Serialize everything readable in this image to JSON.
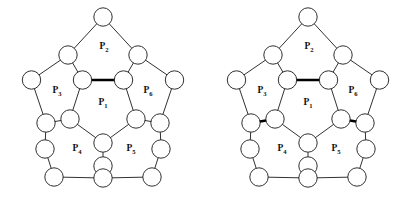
{
  "figure": {
    "title": "",
    "background_color": "#ffffff",
    "stroke_color": "#1a1a1a",
    "bold_stroke_color": "#000000",
    "node_fill": "#ffffff",
    "width": 410,
    "height": 197,
    "panel_count": 2
  },
  "face_labels": {
    "p1": "P",
    "p1_sub": "1",
    "p2": "P",
    "p2_sub": "2",
    "p3": "P",
    "p3_sub": "3",
    "p4": "P",
    "p4_sub": "4",
    "p5": "P",
    "p5_sub": "5",
    "p6": "P",
    "p6_sub": "6"
  },
  "graph": {
    "type": "dodecahedral-schlegel-diagram",
    "node_radius": 9.2,
    "node_count": 20,
    "edge_count": 30,
    "nodes": [
      {
        "id": "i1",
        "x": 82.5,
        "y": 80.0
      },
      {
        "id": "i2",
        "x": 123.5,
        "y": 80.0
      },
      {
        "id": "i3",
        "x": 136.0,
        "y": 119.0
      },
      {
        "id": "i4",
        "x": 103.0,
        "y": 143.0
      },
      {
        "id": "i5",
        "x": 70.0,
        "y": 119.0
      },
      {
        "id": "m1",
        "x": 68.0,
        "y": 55.0
      },
      {
        "id": "m2",
        "x": 138.0,
        "y": 55.0
      },
      {
        "id": "m3",
        "x": 160.0,
        "y": 123.0
      },
      {
        "id": "m4",
        "x": 103.0,
        "y": 166.0
      },
      {
        "id": "m5",
        "x": 46.0,
        "y": 123.0
      },
      {
        "id": "n1",
        "x": 103.0,
        "y": 17.0
      },
      {
        "id": "n2",
        "x": 174.5,
        "y": 80.0
      },
      {
        "id": "n3",
        "x": 159.0,
        "y": 150.0
      },
      {
        "id": "n4",
        "x": 47.0,
        "y": 150.0
      },
      {
        "id": "n5",
        "x": 31.5,
        "y": 80.0
      },
      {
        "id": "o1",
        "x": 161.0,
        "y": 149.0
      },
      {
        "id": "o2",
        "x": 152.0,
        "y": 177.0
      },
      {
        "id": "o3",
        "x": 103.0,
        "y": 178.0
      },
      {
        "id": "o4",
        "x": 54.0,
        "y": 177.0
      },
      {
        "id": "o5",
        "x": 45.0,
        "y": 149.0
      }
    ],
    "inner_pentagon": [
      "i1",
      "i2",
      "i3",
      "i4",
      "i5"
    ],
    "spokes": [
      [
        "i1",
        "m1"
      ],
      [
        "i2",
        "m2"
      ],
      [
        "i3",
        "m3"
      ],
      [
        "i4",
        "m4"
      ],
      [
        "i5",
        "m5"
      ]
    ],
    "outer_ring": [
      "m1",
      "n1",
      "m2",
      "n2",
      "m3",
      "o1",
      "o2",
      "o3",
      "o4",
      "o5",
      "m5",
      "n5"
    ]
  },
  "panels": [
    {
      "id": "left-figure",
      "name": "left-dodecahedral-graph",
      "bold_edges": [
        [
          "i1",
          "i2"
        ]
      ],
      "bold_edge_count": 1
    },
    {
      "id": "right-figure",
      "name": "right-dodecahedral-graph",
      "bold_edges": [
        [
          "i1",
          "i2"
        ],
        [
          "i5",
          "m5"
        ],
        [
          "i3",
          "m3"
        ]
      ],
      "bold_edge_count": 3
    }
  ]
}
